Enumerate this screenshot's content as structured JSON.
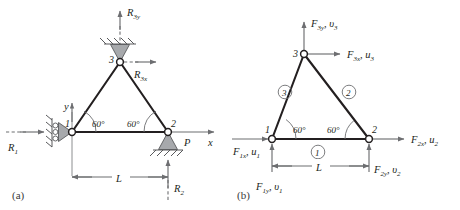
{
  "figure": {
    "panels": [
      {
        "id": "a",
        "label": "(a)",
        "description": "Supported truss with reactions and applied load",
        "nodes": [
          {
            "id": "1",
            "label": "1"
          },
          {
            "id": "2",
            "label": "2"
          },
          {
            "id": "3",
            "label": "3"
          }
        ],
        "angles": [
          {
            "at": "1",
            "label": "60°"
          },
          {
            "at": "2",
            "label": "60°"
          }
        ],
        "axes": [
          {
            "name": "x-axis",
            "label": "x"
          },
          {
            "name": "y-axis",
            "label": "y"
          }
        ],
        "loads": [
          {
            "name": "applied-load-P",
            "label": "P",
            "at": "2",
            "direction": "right"
          }
        ],
        "reactions": [
          {
            "name": "reaction-R1",
            "base": "R",
            "sub": "1",
            "at": "1",
            "direction": "right"
          },
          {
            "name": "reaction-R2",
            "base": "R",
            "sub": "2",
            "at": "2",
            "direction": "up"
          },
          {
            "name": "reaction-R3x",
            "base": "R",
            "sub": "3x",
            "at": "3",
            "direction": "right"
          },
          {
            "name": "reaction-R3y",
            "base": "R",
            "sub": "3y",
            "at": "3",
            "direction": "up"
          }
        ],
        "dimension": {
          "name": "span-dimension",
          "label": "L"
        },
        "supports": [
          {
            "name": "roller-support-node-1",
            "type": "roller-vertical-wall"
          },
          {
            "name": "pin-support-node-2",
            "type": "pin-ground"
          },
          {
            "name": "pin-support-node-3",
            "type": "pin-ceiling"
          }
        ]
      },
      {
        "id": "b",
        "label": "(b)",
        "description": "Free-body / element numbering with nodal forces and displacements",
        "nodes": [
          {
            "id": "1",
            "label": "1"
          },
          {
            "id": "2",
            "label": "2"
          },
          {
            "id": "3",
            "label": "3"
          }
        ],
        "angles": [
          {
            "at": "1",
            "label": "60°"
          },
          {
            "at": "2",
            "label": "60°"
          }
        ],
        "elements": [
          {
            "name": "element-1",
            "label": "1",
            "position": "bottom-chord"
          },
          {
            "name": "element-2",
            "label": "2",
            "position": "right-diagonal"
          },
          {
            "name": "element-3",
            "label": "3",
            "position": "left-diagonal"
          }
        ],
        "nodal_forces": [
          {
            "name": "force-F1x-u1",
            "force_base": "F",
            "force_sub": "1x",
            "disp_base": "u",
            "disp_sub": "1",
            "text": "F1x, u1",
            "at": "1",
            "direction": "right"
          },
          {
            "name": "force-F1y-v1",
            "force_base": "F",
            "force_sub": "1y",
            "disp_base": "υ",
            "disp_sub": "1",
            "text": "F1y, υ1",
            "at": "1",
            "direction": "up"
          },
          {
            "name": "force-F2x-u2",
            "force_base": "F",
            "force_sub": "2x",
            "disp_base": "u",
            "disp_sub": "2",
            "text": "F2x, u2",
            "at": "2",
            "direction": "right"
          },
          {
            "name": "force-F2y-v2",
            "force_base": "F",
            "force_sub": "2y",
            "disp_base": "υ",
            "disp_sub": "2",
            "text": "F2y, υ2",
            "at": "2",
            "direction": "up"
          },
          {
            "name": "force-F3x-u3",
            "force_base": "F",
            "force_sub": "3x",
            "disp_base": "u",
            "disp_sub": "3",
            "text": "F3x, u3",
            "at": "3",
            "direction": "right"
          },
          {
            "name": "force-F3y-v3",
            "force_base": "F",
            "force_sub": "3y",
            "disp_base": "υ",
            "disp_sub": "3",
            "text": "F3y, υ3",
            "at": "3",
            "direction": "up"
          }
        ],
        "dimension": {
          "name": "span-dimension",
          "label": "L"
        }
      }
    ],
    "colors": {
      "member": "#231f20",
      "arrow": "#6d6e71",
      "support_fill": "#a7a9ac",
      "background": "#ffffff"
    },
    "symbols": {
      "comma": ",",
      "degree": "°",
      "u": "u",
      "v": "υ",
      "F": "F",
      "R": "R",
      "P": "P",
      "L": "L",
      "x": "x",
      "y": "y"
    }
  }
}
